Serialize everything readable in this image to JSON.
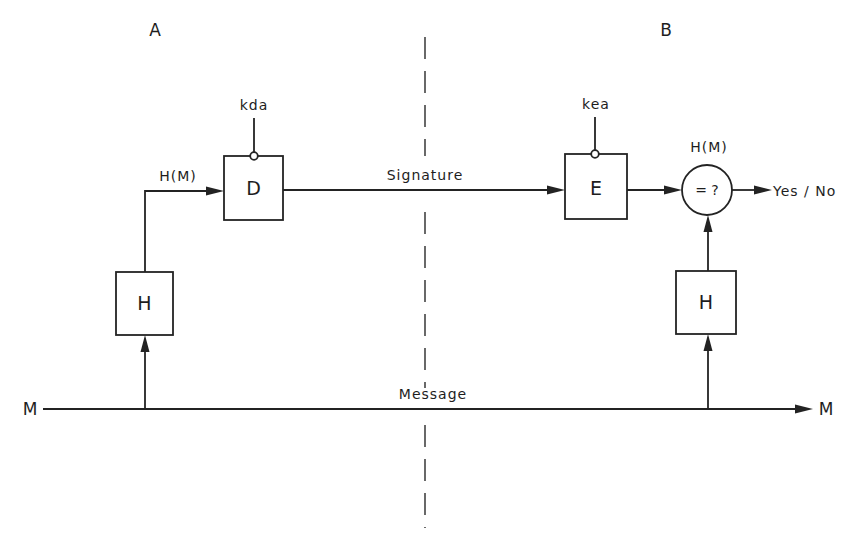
{
  "diagram": {
    "parties": {
      "sender": "A",
      "receiver": "B"
    },
    "left": {
      "hash_box": "H",
      "hash_output_label": "H(M)",
      "sign_box": "D",
      "sign_key": "kda"
    },
    "channel": {
      "signature_label": "Signature",
      "message_label": "Message",
      "message_in": "M",
      "message_out": "M"
    },
    "right": {
      "verify_box": "E",
      "verify_key": "kea",
      "compare_label": "= ?",
      "compare_top_label": "H(M)",
      "result_label": "Yes / No",
      "hash_box": "H"
    },
    "colors": {
      "ink": "#232323",
      "background": "#ffffff"
    }
  }
}
